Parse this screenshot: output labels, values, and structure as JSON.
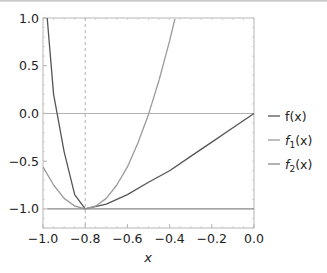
{
  "chart_data": {
    "type": "line",
    "title": "",
    "xlabel": "x",
    "ylabel": "",
    "xlim": [
      -1.0,
      0.0
    ],
    "ylim": [
      -1.2,
      1.0
    ],
    "x_ticks": [
      "-1.0",
      "-0.8",
      "-0.6",
      "-0.4",
      "-0.2",
      "0.0"
    ],
    "y_ticks": [
      "1.0",
      "0.5",
      "0.0",
      "-0.5",
      "-1.0"
    ],
    "grid": false,
    "reference_lines": [
      {
        "orientation": "vertical",
        "x": -0.8,
        "style": "dashed"
      },
      {
        "orientation": "horizontal",
        "y": 0.0,
        "style": "solid"
      }
    ],
    "legend_position": "right",
    "series": [
      {
        "name": "f(x)",
        "color": "#555555",
        "x": [
          -0.98,
          -0.95,
          -0.9,
          -0.85,
          -0.8,
          -0.7,
          -0.6,
          -0.5,
          -0.4,
          -0.3,
          -0.2,
          -0.1,
          0.0
        ],
        "y": [
          1.0,
          0.2,
          -0.4,
          -0.85,
          -1.0,
          -0.95,
          -0.85,
          -0.72,
          -0.6,
          -0.45,
          -0.3,
          -0.15,
          0.0
        ]
      },
      {
        "name": "f1(x)",
        "color": "#9a9a9a",
        "x": [
          -1.0,
          -0.95,
          -0.9,
          -0.85,
          -0.8,
          -0.75,
          -0.7,
          -0.65,
          -0.6,
          -0.55,
          -0.5,
          -0.45,
          -0.4,
          -0.375
        ],
        "y": [
          -0.56,
          -0.75,
          -0.89,
          -0.97,
          -1.0,
          -0.97,
          -0.89,
          -0.75,
          -0.56,
          -0.31,
          -0.01,
          0.35,
          0.76,
          0.99
        ]
      },
      {
        "name": "f2(x)",
        "color": "#888888",
        "x": [
          -0.98,
          0.0
        ],
        "y": [
          -1.0,
          -1.0
        ]
      }
    ]
  },
  "legend": {
    "items": [
      {
        "label": "f(x)",
        "base": "f",
        "sub": "",
        "arg": "(x)"
      },
      {
        "label": "f1(x)",
        "base": "f",
        "sub": "1",
        "arg": "(x)"
      },
      {
        "label": "f2(x)",
        "base": "f",
        "sub": "2",
        "arg": "(x)"
      }
    ]
  }
}
